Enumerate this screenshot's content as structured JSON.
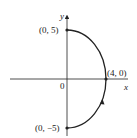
{
  "diagram": {
    "axes": {
      "x_label": "x",
      "y_label": "y",
      "origin_label": "0"
    },
    "points": [
      {
        "label": "(0, 5)",
        "x": 0,
        "y": 5
      },
      {
        "label": "(4, 0)",
        "x": 4,
        "y": 0
      },
      {
        "label": "(0, −5)",
        "x": 0,
        "y": -5
      }
    ],
    "curve": "right half of ellipse x²/16 + y²/25 = 1 from (0,−5) to (0,5), oriented counterclockwise",
    "colors": {
      "line": "#222222",
      "background": "#ffffff"
    }
  }
}
